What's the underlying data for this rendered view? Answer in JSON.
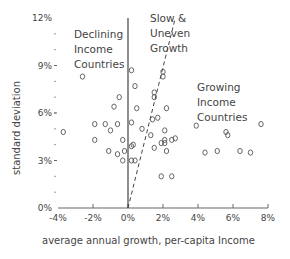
{
  "chart_data": {
    "type": "scatter",
    "title": "",
    "xlabel": "average annual growth, per-capita Income",
    "ylabel": "standard deviation",
    "xlim": [
      -4,
      8
    ],
    "ylim": [
      0,
      12
    ],
    "x_ticks": [
      "-4%",
      "-2%",
      "0%",
      "2%",
      "4%",
      "6%",
      "8%"
    ],
    "y_ticks": [
      "0%",
      "3%",
      "6%",
      "9%",
      "12%"
    ],
    "grid": false,
    "annotations": [
      {
        "text": [
          "Declining",
          "Income",
          "Countries"
        ],
        "region": "x<0"
      },
      {
        "text": [
          "Slow &",
          "Uneven",
          "Growth"
        ],
        "region": "between 0 and dashed line"
      },
      {
        "text": [
          "Growing",
          "Income",
          "Countries"
        ],
        "region": "right of dashed line"
      }
    ],
    "reference_lines": [
      {
        "type": "solid vertical",
        "x": 0
      },
      {
        "type": "dashed",
        "from": [
          0,
          0
        ],
        "to": [
          2.7,
          12
        ]
      }
    ],
    "points": [
      {
        "x": -3.7,
        "y": 4.8
      },
      {
        "x": -2.6,
        "y": 8.3
      },
      {
        "x": -1.9,
        "y": 5.3
      },
      {
        "x": -1.3,
        "y": 5.3
      },
      {
        "x": -0.6,
        "y": 5.3
      },
      {
        "x": -1.9,
        "y": 4.3
      },
      {
        "x": -1.0,
        "y": 4.9
      },
      {
        "x": -0.3,
        "y": 4.3
      },
      {
        "x": -1.1,
        "y": 3.6
      },
      {
        "x": -0.6,
        "y": 3.4
      },
      {
        "x": -0.2,
        "y": 3.6
      },
      {
        "x": -0.3,
        "y": 3.0
      },
      {
        "x": -0.8,
        "y": 6.4
      },
      {
        "x": -0.5,
        "y": 7.0
      },
      {
        "x": 0.2,
        "y": 3.9
      },
      {
        "x": 0.3,
        "y": 4.0
      },
      {
        "x": 0.2,
        "y": 3.0
      },
      {
        "x": 0.4,
        "y": 3.0
      },
      {
        "x": 0.2,
        "y": 8.7
      },
      {
        "x": 0.4,
        "y": 7.7
      },
      {
        "x": 0.2,
        "y": 5.4
      },
      {
        "x": 0.5,
        "y": 6.3
      },
      {
        "x": 0.8,
        "y": 5.0
      },
      {
        "x": 1.5,
        "y": 7.3
      },
      {
        "x": 1.5,
        "y": 7.0
      },
      {
        "x": 1.4,
        "y": 5.6
      },
      {
        "x": 1.3,
        "y": 4.6
      },
      {
        "x": 2.0,
        "y": 8.6
      },
      {
        "x": 2.0,
        "y": 8.3
      },
      {
        "x": 2.2,
        "y": 6.3
      },
      {
        "x": 1.7,
        "y": 5.7
      },
      {
        "x": 1.5,
        "y": 3.8
      },
      {
        "x": 2.1,
        "y": 4.9
      },
      {
        "x": 2.1,
        "y": 4.3
      },
      {
        "x": 1.9,
        "y": 4.1
      },
      {
        "x": 2.1,
        "y": 4.1
      },
      {
        "x": 2.5,
        "y": 4.3
      },
      {
        "x": 2.7,
        "y": 4.4
      },
      {
        "x": 2.2,
        "y": 3.6
      },
      {
        "x": 1.9,
        "y": 2.0
      },
      {
        "x": 2.5,
        "y": 2.0
      },
      {
        "x": 3.9,
        "y": 5.2
      },
      {
        "x": 4.4,
        "y": 3.5
      },
      {
        "x": 5.1,
        "y": 3.6
      },
      {
        "x": 5.6,
        "y": 4.8
      },
      {
        "x": 5.7,
        "y": 4.6
      },
      {
        "x": 6.4,
        "y": 3.6
      },
      {
        "x": 7.0,
        "y": 3.5
      },
      {
        "x": 7.6,
        "y": 5.3
      }
    ]
  }
}
